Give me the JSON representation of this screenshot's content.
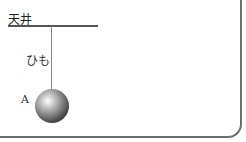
{
  "diagram": {
    "ceiling_label": "天井",
    "string_label": "ひも",
    "ball_label": "A"
  },
  "colors": {
    "line": "#555555",
    "frame": "#6e6e6e",
    "ball_dark": "#1a1a1a",
    "ball_highlight": "#ffffff"
  }
}
